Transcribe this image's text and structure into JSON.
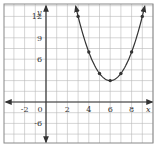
{
  "chart_data": {
    "type": "line",
    "title": "",
    "xlabel": "x",
    "ylabel": "y",
    "function": "y = (x - 6)^2 + 3",
    "xlim": [
      -4,
      10
    ],
    "ylim": [
      -6,
      13.5
    ],
    "x_tick_labels": [
      "-2",
      "0",
      "2",
      "4",
      "6",
      "8"
    ],
    "x_tick_values": [
      -2,
      0,
      2,
      4,
      6,
      8
    ],
    "y_tick_labels": [
      "-6",
      "6",
      "9",
      "12"
    ],
    "y_tick_values": [
      -6,
      6,
      9,
      12
    ],
    "grid": true,
    "legend": null,
    "series": [
      {
        "name": "parabola",
        "x": [
          3,
          4,
          5,
          6,
          7,
          8,
          9
        ],
        "y": [
          12,
          7,
          4,
          3,
          4,
          7,
          12
        ],
        "markers": true,
        "arrows_at_ends": true
      }
    ],
    "vertex": [
      6,
      3
    ]
  },
  "colors": {
    "grid": "#b8b8b8",
    "axis": "#333333",
    "curve": "#333333",
    "frame": "#888888"
  }
}
